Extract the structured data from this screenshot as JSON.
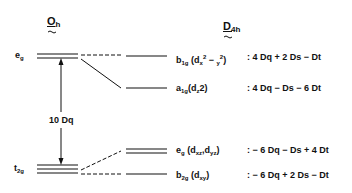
{
  "headers": {
    "left_group": "O",
    "left_group_sub": "h",
    "right_group": "D",
    "right_group_sub": "4h"
  },
  "left_levels": {
    "eg": {
      "main": "e",
      "sub": "g"
    },
    "t2g": {
      "main": "t",
      "sub": "2g"
    }
  },
  "splitting_label": "10 Dq",
  "right_levels": [
    {
      "sym": "b",
      "sym_sub": "1g",
      "orbital": "(d",
      "orb_sub": "x",
      "orb_rest": "2 − y",
      "orb_rest2": "2)",
      "energy": ": 4 Dq + 2 Ds − Dt"
    },
    {
      "sym": "a",
      "sym_sub": "1g",
      "orbital": "(d",
      "orb_sub": "z",
      "orb_rest": "2)",
      "energy": ": 4 Dq − Ds − 6 Dt"
    },
    {
      "sym": "e",
      "sym_sub": "g",
      "orbital": "(d",
      "orb_sub": "xz",
      "orb_rest": ",d",
      "orb_sub2": "yz",
      "orb_end": ")",
      "energy": ": − 6 Dq − Ds + 4 Dt"
    },
    {
      "sym": "b",
      "sym_sub": "2g",
      "orbital": "(d",
      "orb_sub": "xy",
      "orb_end": ")",
      "energy": ": − 6 Dq + 2 Ds − Dt"
    }
  ]
}
